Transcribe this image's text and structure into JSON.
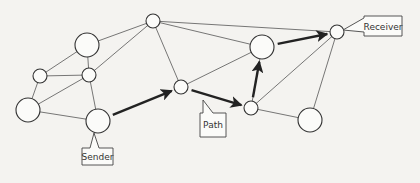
{
  "diagram": {
    "type": "network-graph",
    "nodes": [
      {
        "id": "A",
        "size": "small"
      },
      {
        "id": "B",
        "size": "large"
      },
      {
        "id": "C",
        "size": "small"
      },
      {
        "id": "D",
        "size": "small"
      },
      {
        "id": "E",
        "size": "large"
      },
      {
        "id": "F",
        "size": "large",
        "role": "sender"
      },
      {
        "id": "G",
        "size": "small"
      },
      {
        "id": "H",
        "size": "large"
      },
      {
        "id": "I",
        "size": "small",
        "role": "receiver"
      },
      {
        "id": "J",
        "size": "small"
      },
      {
        "id": "K",
        "size": "large"
      }
    ],
    "edges": [
      [
        "B",
        "A"
      ],
      [
        "B",
        "C"
      ],
      [
        "B",
        "D"
      ],
      [
        "C",
        "D"
      ],
      [
        "C",
        "E"
      ],
      [
        "D",
        "E"
      ],
      [
        "D",
        "F"
      ],
      [
        "E",
        "F"
      ],
      [
        "D",
        "A"
      ],
      [
        "A",
        "G"
      ],
      [
        "A",
        "H"
      ],
      [
        "A",
        "I"
      ],
      [
        "G",
        "H"
      ],
      [
        "H",
        "J"
      ],
      [
        "J",
        "I"
      ],
      [
        "J",
        "K"
      ],
      [
        "K",
        "I"
      ]
    ],
    "path": [
      [
        "F",
        "G"
      ],
      [
        "G",
        "J"
      ],
      [
        "J",
        "H"
      ],
      [
        "H",
        "I"
      ]
    ],
    "labels": {
      "sender": "Sender",
      "path": "Path",
      "receiver": "Receiver"
    }
  }
}
